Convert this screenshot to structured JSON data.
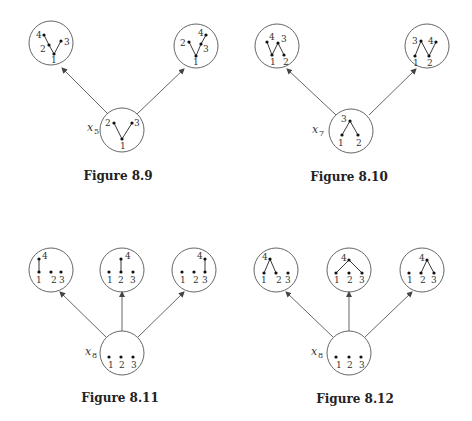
{
  "figures": [
    {
      "caption": "Figure 8.9",
      "root": {
        "var": "x",
        "sub": "5",
        "nodes": [
          "1",
          "2",
          "3"
        ]
      },
      "children": [
        {
          "nodes": [
            "1",
            "2",
            "3",
            "4"
          ]
        },
        {
          "nodes": [
            "1",
            "2",
            "3",
            "4"
          ]
        }
      ]
    },
    {
      "caption": "Figure 8.10",
      "root": {
        "var": "x",
        "sub": "7",
        "nodes": [
          "1",
          "2",
          "3"
        ]
      },
      "children": [
        {
          "nodes": [
            "1",
            "2",
            "3",
            "4"
          ]
        },
        {
          "nodes": [
            "1",
            "2",
            "3",
            "4"
          ]
        }
      ]
    },
    {
      "caption": "Figure 8.11",
      "root": {
        "var": "x",
        "sub": "8",
        "nodes": [
          "1",
          "2",
          "3"
        ]
      },
      "children": [
        {
          "nodes": [
            "1",
            "2",
            "3",
            "4"
          ]
        },
        {
          "nodes": [
            "1",
            "2",
            "3",
            "4"
          ]
        },
        {
          "nodes": [
            "1",
            "2",
            "3",
            "4"
          ]
        }
      ]
    },
    {
      "caption": "Figure 8.12",
      "root": {
        "var": "x",
        "sub": "8",
        "nodes": [
          "1",
          "2",
          "3"
        ]
      },
      "children": [
        {
          "nodes": [
            "1",
            "2",
            "3",
            "4"
          ]
        },
        {
          "nodes": [
            "1",
            "2",
            "3",
            "4"
          ]
        },
        {
          "nodes": [
            "1",
            "2",
            "3",
            "4"
          ]
        }
      ]
    }
  ]
}
